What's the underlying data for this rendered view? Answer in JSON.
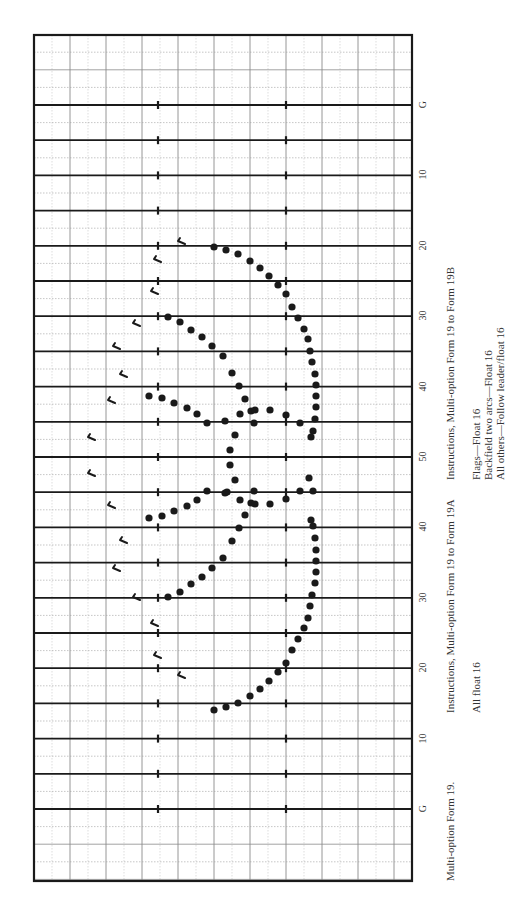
{
  "chart": {
    "title": "Multi-option Form 19.",
    "instructions_a": {
      "heading": "Instructions, Multi-option Form 19 to Form 19A",
      "lines": [
        "All float 16"
      ]
    },
    "instructions_b": {
      "heading": "Instructions, Multi-option Form 19 to Form 19B",
      "lines": [
        "Flags—Float 16",
        "Backfield two arcs—Float 16",
        "All others—Follow leader/float 16"
      ]
    },
    "yard_labels": [
      "G",
      "10",
      "20",
      "30",
      "40",
      "50",
      "40",
      "30",
      "20",
      "10",
      "G"
    ],
    "colors": {
      "line": "#1a1a1a",
      "grid": "#9a9a9a",
      "dot": "#1a1a1a",
      "background": "#ffffff"
    }
  },
  "chart_data": {
    "type": "scatter",
    "title": "Multi-option Form 19.",
    "xlabel": "",
    "ylabel": "Yard line",
    "y_tick_labels": [
      "G",
      "10",
      "20",
      "30",
      "40",
      "50",
      "40",
      "30",
      "20",
      "10",
      "G"
    ],
    "grid": true,
    "legend": [
      {
        "name": "Band members (dots)",
        "symbol": "filled-circle"
      },
      {
        "name": "Flags",
        "symbol": "flag"
      }
    ],
    "series": [
      {
        "name": "Band members",
        "points": [
          [
            214,
            247
          ],
          [
            226,
            250
          ],
          [
            238,
            254
          ],
          [
            250,
            261
          ],
          [
            260,
            268
          ],
          [
            269,
            276
          ],
          [
            278,
            285
          ],
          [
            286,
            294
          ],
          [
            292,
            307
          ],
          [
            298,
            318
          ],
          [
            304,
            329
          ],
          [
            308,
            339
          ],
          [
            310,
            351
          ],
          [
            312,
            362
          ],
          [
            315,
            374
          ],
          [
            316,
            385
          ],
          [
            316,
            396
          ],
          [
            316,
            407
          ],
          [
            315,
            419
          ],
          [
            313,
            431
          ],
          [
            311,
            437
          ],
          [
            168,
            317
          ],
          [
            180,
            322
          ],
          [
            191,
            330
          ],
          [
            202,
            337
          ],
          [
            212,
            346
          ],
          [
            223,
            356
          ],
          [
            232,
            373
          ],
          [
            239,
            386
          ],
          [
            245,
            399
          ],
          [
            251,
            411
          ],
          [
            254,
            423
          ],
          [
            149,
            396
          ],
          [
            162,
            398
          ],
          [
            174,
            403
          ],
          [
            187,
            408
          ],
          [
            197,
            414
          ],
          [
            207,
            423
          ],
          [
            225,
            421
          ],
          [
            240,
            414
          ],
          [
            255,
            410
          ],
          [
            270,
            410
          ],
          [
            286,
            415
          ],
          [
            300,
            423
          ],
          [
            235,
            435
          ],
          [
            230,
            450
          ],
          [
            230,
            465
          ],
          [
            235,
            480
          ],
          [
            227,
            492
          ],
          [
            214,
            710
          ],
          [
            226,
            707
          ],
          [
            238,
            703
          ],
          [
            250,
            696
          ],
          [
            260,
            689
          ],
          [
            269,
            681
          ],
          [
            278,
            672
          ],
          [
            286,
            663
          ],
          [
            292,
            650
          ],
          [
            298,
            639
          ],
          [
            304,
            628
          ],
          [
            308,
            618
          ],
          [
            310,
            606
          ],
          [
            312,
            595
          ],
          [
            315,
            583
          ],
          [
            316,
            572
          ],
          [
            316,
            561
          ],
          [
            316,
            550
          ],
          [
            315,
            538
          ],
          [
            313,
            526
          ],
          [
            311,
            520
          ],
          [
            168,
            597
          ],
          [
            180,
            592
          ],
          [
            191,
            584
          ],
          [
            202,
            577
          ],
          [
            212,
            568
          ],
          [
            223,
            558
          ],
          [
            232,
            541
          ],
          [
            239,
            528
          ],
          [
            245,
            515
          ],
          [
            251,
            503
          ],
          [
            254,
            491
          ],
          [
            149,
            518
          ],
          [
            162,
            516
          ],
          [
            174,
            511
          ],
          [
            187,
            506
          ],
          [
            197,
            500
          ],
          [
            207,
            491
          ],
          [
            225,
            493
          ],
          [
            240,
            500
          ],
          [
            255,
            504
          ],
          [
            270,
            504
          ],
          [
            286,
            499
          ],
          [
            300,
            491
          ],
          [
            313,
            491
          ],
          [
            309,
            478
          ]
        ]
      },
      {
        "name": "Flags",
        "points": [
          [
            182,
            241
          ],
          [
            158,
            259
          ],
          [
            155,
            291
          ],
          [
            137,
            323
          ],
          [
            117,
            346
          ],
          [
            124,
            374
          ],
          [
            112,
            400
          ],
          [
            92,
            437
          ],
          [
            92,
            473
          ],
          [
            112,
            505
          ],
          [
            124,
            540
          ],
          [
            117,
            568
          ],
          [
            137,
            597
          ],
          [
            155,
            623
          ],
          [
            158,
            655
          ],
          [
            182,
            675
          ]
        ]
      }
    ]
  }
}
